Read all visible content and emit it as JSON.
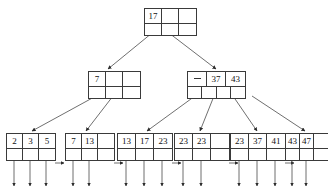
{
  "diagram": {
    "type": "b-plus-tree",
    "line_color": "#3a3a3a",
    "text_color": "#111111",
    "background": "#ffffff",
    "levels": [
      {
        "name": "root",
        "nodes": [
          {
            "id": "root",
            "x": 144,
            "y": 8,
            "cell_width": 17,
            "keys": [
              "17",
              "",
              ""
            ],
            "pointers": 3,
            "active_pointers": [
              0,
              1
            ]
          }
        ]
      },
      {
        "name": "internal",
        "nodes": [
          {
            "id": "internal-left",
            "x": 88,
            "y": 71,
            "cell_width": 17,
            "keys": [
              "7",
              "",
              ""
            ],
            "pointers": 3,
            "active_pointers": [
              0,
              1
            ]
          },
          {
            "id": "internal-right",
            "x": 187,
            "y": 71,
            "cell_width": 19,
            "keys": [
              "—",
              "37",
              "43"
            ],
            "pointers": 4,
            "active_pointers": [
              0,
              1,
              2,
              3
            ]
          }
        ]
      },
      {
        "name": "leaves",
        "nodes": [
          {
            "id": "leaf-1",
            "x": 6,
            "y": 133,
            "cell_width": 16,
            "keys": [
              "2",
              "3",
              "5"
            ],
            "filled": 3,
            "has_next": true
          },
          {
            "id": "leaf-2",
            "x": 65,
            "y": 133,
            "cell_width": 16,
            "keys": [
              "7",
              "13",
              ""
            ],
            "filled": 2,
            "has_next": true
          },
          {
            "id": "leaf-3",
            "x": 117,
            "y": 133,
            "cell_width": 18,
            "keys": [
              "13",
              "17",
              "23"
            ],
            "filled": 3,
            "has_next": true
          },
          {
            "id": "leaf-4",
            "x": 174,
            "y": 133,
            "cell_width": 18,
            "keys": [
              "23",
              "23",
              ""
            ],
            "filled": 2,
            "has_next": true
          },
          {
            "id": "leaf-5",
            "x": 230,
            "y": 133,
            "cell_width": 18,
            "keys": [
              "23",
              "37",
              "41"
            ],
            "filled": 3,
            "has_next": true
          },
          {
            "id": "leaf-6",
            "x": 285,
            "y": 133,
            "cell_width": 14,
            "keys": [
              "43",
              "47",
              ""
            ],
            "filled": 2,
            "has_next": false
          }
        ]
      }
    ]
  }
}
